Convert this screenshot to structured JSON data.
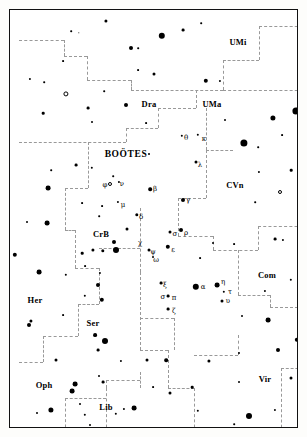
{
  "chart_data": {
    "type": "scatter",
    "subtitle": "",
    "xlabel": "",
    "ylabel": "",
    "grid": false,
    "legend": "none",
    "xlim": [
      0,
      289
    ],
    "ylim": [
      0,
      419
    ],
    "frame": {
      "left": 9,
      "top": 9,
      "width": 289,
      "height": 419,
      "border_color": "#111111"
    },
    "colors": {
      "star": "#000000",
      "boundary": "#999999",
      "background": "#ffffff",
      "label": "#000000"
    },
    "constellation_labels": [
      {
        "name": "UMi",
        "x": 228,
        "y": 32,
        "major": false
      },
      {
        "name": "Dra",
        "x": 139,
        "y": 94,
        "major": false
      },
      {
        "name": "UMa",
        "x": 202,
        "y": 94,
        "major": false
      },
      {
        "name": "BOOTES",
        "text": "BOÖTES",
        "x": 116,
        "y": 145,
        "major": true
      },
      {
        "name": "CVn",
        "x": 225,
        "y": 175,
        "major": false
      },
      {
        "name": "CrB",
        "x": 91,
        "y": 224,
        "major": false
      },
      {
        "name": "Com",
        "x": 257,
        "y": 265,
        "major": false
      },
      {
        "name": "Her",
        "x": 25,
        "y": 290,
        "major": false
      },
      {
        "name": "Ser",
        "x": 83,
        "y": 313,
        "major": false
      },
      {
        "name": "Oph",
        "x": 34,
        "y": 375,
        "major": false
      },
      {
        "name": "Lib",
        "x": 96,
        "y": 397,
        "major": false
      },
      {
        "name": "Vir",
        "x": 255,
        "y": 369,
        "major": false
      },
      {
        "name": "Crv",
        "x": 285,
        "y": 427,
        "major": false
      },
      {
        "name": "Sco",
        "x": 68,
        "y": 430,
        "major": false
      }
    ],
    "bayer_labels": [
      {
        "glyph": "θ",
        "x": 176,
        "y": 128
      },
      {
        "glyph": "κ",
        "x": 194,
        "y": 129
      },
      {
        "glyph": "λ",
        "x": 190,
        "y": 155
      },
      {
        "glyph": "φ",
        "x": 95,
        "y": 175
      },
      {
        "glyph": "ν",
        "x": 112,
        "y": 174
      },
      {
        "glyph": "β",
        "x": 145,
        "y": 179
      },
      {
        "glyph": "γ",
        "x": 178,
        "y": 190
      },
      {
        "glyph": "μ",
        "x": 113,
        "y": 195
      },
      {
        "glyph": "δ",
        "x": 131,
        "y": 207
      },
      {
        "glyph": "χ",
        "x": 130,
        "y": 233
      },
      {
        "glyph": "σ",
        "x": 165,
        "y": 224
      },
      {
        "glyph": "ρ",
        "x": 176,
        "y": 223
      },
      {
        "glyph": "ψ",
        "x": 143,
        "y": 242
      },
      {
        "glyph": "ε",
        "x": 163,
        "y": 240
      },
      {
        "glyph": "ω",
        "x": 146,
        "y": 250
      },
      {
        "glyph": "ξ",
        "x": 155,
        "y": 275
      },
      {
        "glyph": "α",
        "x": 193,
        "y": 277
      },
      {
        "glyph": "η",
        "x": 213,
        "y": 272
      },
      {
        "glyph": "σ",
        "x": 153,
        "y": 287
      },
      {
        "glyph": "π",
        "x": 164,
        "y": 288
      },
      {
        "glyph": "τ",
        "x": 220,
        "y": 282
      },
      {
        "glyph": "υ",
        "x": 218,
        "y": 291
      },
      {
        "glyph": "ζ",
        "x": 164,
        "y": 301
      }
    ],
    "stars": [
      {
        "x": 96,
        "y": 11,
        "r": 1.6
      },
      {
        "x": 173,
        "y": 20,
        "r": 1.4
      },
      {
        "x": 191,
        "y": 13,
        "r": 0.8
      },
      {
        "x": 152,
        "y": 26,
        "r": 3.2
      },
      {
        "x": 61,
        "y": 21,
        "r": 0.8
      },
      {
        "x": 69,
        "y": 23,
        "r": 0.7
      },
      {
        "x": 121,
        "y": 38,
        "r": 2.0
      },
      {
        "x": 128,
        "y": 38,
        "r": 0.8
      },
      {
        "x": 292,
        "y": 47,
        "r": 1.4
      },
      {
        "x": 53,
        "y": 51,
        "r": 0.9
      },
      {
        "x": 128,
        "y": 60,
        "r": 0.9
      },
      {
        "x": 144,
        "y": 64,
        "r": 1.5
      },
      {
        "x": 196,
        "y": 71,
        "r": 2.2
      },
      {
        "x": 210,
        "y": 71,
        "r": 1.1
      },
      {
        "x": 20,
        "y": 69,
        "r": 1.1
      },
      {
        "x": 34,
        "y": 72,
        "r": 0.8
      },
      {
        "x": 56,
        "y": 84,
        "r": 2.6,
        "open": true
      },
      {
        "x": 94,
        "y": 81,
        "r": 0.8
      },
      {
        "x": 78,
        "y": 98,
        "r": 1.4
      },
      {
        "x": 116,
        "y": 95,
        "r": 2.0
      },
      {
        "x": 33,
        "y": 103,
        "r": 1.3
      },
      {
        "x": 286,
        "y": 101,
        "r": 3.6
      },
      {
        "x": 263,
        "y": 108,
        "r": 2.6
      },
      {
        "x": 215,
        "y": 110,
        "r": 1.0
      },
      {
        "x": 172,
        "y": 126,
        "r": 1.2
      },
      {
        "x": 188,
        "y": 125,
        "r": 1.2
      },
      {
        "x": 82,
        "y": 112,
        "r": 1.0
      },
      {
        "x": 136,
        "y": 113,
        "r": 0.9
      },
      {
        "x": 234,
        "y": 133,
        "r": 3.6
      },
      {
        "x": 186,
        "y": 152,
        "r": 1.5
      },
      {
        "x": 139,
        "y": 144,
        "r": 1.0
      },
      {
        "x": 272,
        "y": 125,
        "r": 0.9
      },
      {
        "x": 248,
        "y": 137,
        "r": 0.8
      },
      {
        "x": 66,
        "y": 155,
        "r": 1.4
      },
      {
        "x": 82,
        "y": 158,
        "r": 1.2
      },
      {
        "x": 41,
        "y": 160,
        "r": 0.8
      },
      {
        "x": 103,
        "y": 166,
        "r": 0.8
      },
      {
        "x": 249,
        "y": 162,
        "r": 1.1
      },
      {
        "x": 281,
        "y": 160,
        "r": 1.3
      },
      {
        "x": 140,
        "y": 179,
        "r": 1.8
      },
      {
        "x": 173,
        "y": 190,
        "r": 2.0
      },
      {
        "x": 100,
        "y": 174,
        "r": 2.0,
        "open": true
      },
      {
        "x": 109,
        "y": 172,
        "r": 1.1
      },
      {
        "x": 38,
        "y": 178,
        "r": 2.4
      },
      {
        "x": 108,
        "y": 192,
        "r": 1.1
      },
      {
        "x": 72,
        "y": 193,
        "r": 0.9
      },
      {
        "x": 92,
        "y": 196,
        "r": 0.9
      },
      {
        "x": 270,
        "y": 182,
        "r": 2.0,
        "open": true
      },
      {
        "x": 292,
        "y": 171,
        "r": 1.1
      },
      {
        "x": 245,
        "y": 192,
        "r": 0.8
      },
      {
        "x": 127,
        "y": 205,
        "r": 1.7
      },
      {
        "x": 89,
        "y": 206,
        "r": 0.8
      },
      {
        "x": 17,
        "y": 212,
        "r": 1.0
      },
      {
        "x": 37,
        "y": 213,
        "r": 2.4
      },
      {
        "x": 117,
        "y": 219,
        "r": 1.5
      },
      {
        "x": 160,
        "y": 222,
        "r": 1.5
      },
      {
        "x": 171,
        "y": 220,
        "r": 2.0
      },
      {
        "x": 104,
        "y": 232,
        "r": 2.0
      },
      {
        "x": 158,
        "y": 237,
        "r": 2.2
      },
      {
        "x": 139,
        "y": 240,
        "r": 1.5
      },
      {
        "x": 143,
        "y": 247,
        "r": 1.0
      },
      {
        "x": 83,
        "y": 240,
        "r": 1.6
      },
      {
        "x": 93,
        "y": 241,
        "r": 1.7
      },
      {
        "x": 106,
        "y": 240,
        "r": 3.0
      },
      {
        "x": 72,
        "y": 243,
        "r": 1.3
      },
      {
        "x": 5,
        "y": 245,
        "r": 2.2
      },
      {
        "x": 203,
        "y": 233,
        "r": 1.0
      },
      {
        "x": 224,
        "y": 234,
        "r": 0.9
      },
      {
        "x": 265,
        "y": 229,
        "r": 1.4
      },
      {
        "x": 273,
        "y": 230,
        "r": 1.1
      },
      {
        "x": 190,
        "y": 248,
        "r": 0.9
      },
      {
        "x": 29,
        "y": 262,
        "r": 2.4
      },
      {
        "x": 56,
        "y": 265,
        "r": 1.2
      },
      {
        "x": 75,
        "y": 256,
        "r": 0.9
      },
      {
        "x": 90,
        "y": 263,
        "r": 1.1
      },
      {
        "x": 186,
        "y": 277,
        "r": 3.2
      },
      {
        "x": 207,
        "y": 275,
        "r": 2.4
      },
      {
        "x": 214,
        "y": 282,
        "r": 1.2
      },
      {
        "x": 212,
        "y": 291,
        "r": 1.5
      },
      {
        "x": 151,
        "y": 273,
        "r": 1.4
      },
      {
        "x": 158,
        "y": 286,
        "r": 1.4
      },
      {
        "x": 158,
        "y": 299,
        "r": 1.4
      },
      {
        "x": 88,
        "y": 275,
        "r": 2.0
      },
      {
        "x": 75,
        "y": 286,
        "r": 1.2
      },
      {
        "x": 92,
        "y": 290,
        "r": 2.2
      },
      {
        "x": 255,
        "y": 281,
        "r": 1.1
      },
      {
        "x": 281,
        "y": 270,
        "r": 1.2
      },
      {
        "x": 290,
        "y": 283,
        "r": 0.9
      },
      {
        "x": 53,
        "y": 305,
        "r": 0.9
      },
      {
        "x": 21,
        "y": 311,
        "r": 1.6
      },
      {
        "x": 19,
        "y": 315,
        "r": 2.0
      },
      {
        "x": 85,
        "y": 325,
        "r": 1.9
      },
      {
        "x": 95,
        "y": 331,
        "r": 3.0
      },
      {
        "x": 88,
        "y": 340,
        "r": 1.4
      },
      {
        "x": 258,
        "y": 310,
        "r": 2.4
      },
      {
        "x": 232,
        "y": 306,
        "r": 1.0
      },
      {
        "x": 268,
        "y": 340,
        "r": 2.0
      },
      {
        "x": 46,
        "y": 350,
        "r": 1.5
      },
      {
        "x": 111,
        "y": 351,
        "r": 1.1
      },
      {
        "x": 137,
        "y": 350,
        "r": 1.5
      },
      {
        "x": 156,
        "y": 350,
        "r": 1.8
      },
      {
        "x": 199,
        "y": 351,
        "r": 1.6
      },
      {
        "x": 229,
        "y": 343,
        "r": 1.0
      },
      {
        "x": 65,
        "y": 374,
        "r": 2.4
      },
      {
        "x": 62,
        "y": 381,
        "r": 2.4
      },
      {
        "x": 93,
        "y": 372,
        "r": 1.4
      },
      {
        "x": 89,
        "y": 366,
        "r": 1.0
      },
      {
        "x": 143,
        "y": 377,
        "r": 0.9
      },
      {
        "x": 160,
        "y": 383,
        "r": 1.5
      },
      {
        "x": 182,
        "y": 377,
        "r": 1.3
      },
      {
        "x": 229,
        "y": 372,
        "r": 1.0
      },
      {
        "x": 281,
        "y": 368,
        "r": 1.5
      },
      {
        "x": 287,
        "y": 330,
        "r": 2.2
      },
      {
        "x": 41,
        "y": 400,
        "r": 2.6
      },
      {
        "x": 27,
        "y": 403,
        "r": 1.0
      },
      {
        "x": 70,
        "y": 394,
        "r": 1.0
      },
      {
        "x": 75,
        "y": 405,
        "r": 1.2
      },
      {
        "x": 124,
        "y": 398,
        "r": 2.4
      },
      {
        "x": 106,
        "y": 404,
        "r": 1.2
      },
      {
        "x": 114,
        "y": 399,
        "r": 1.1
      },
      {
        "x": 188,
        "y": 401,
        "r": 1.2
      },
      {
        "x": 239,
        "y": 406,
        "r": 3.0
      },
      {
        "x": 265,
        "y": 400,
        "r": 1.1
      },
      {
        "x": 43,
        "y": 424,
        "r": 1.0
      },
      {
        "x": 102,
        "y": 421,
        "r": 1.5
      },
      {
        "x": 150,
        "y": 422,
        "r": 1.4,
        "open": true
      },
      {
        "x": 80,
        "y": 415,
        "r": 1.0
      },
      {
        "x": 237,
        "y": 425,
        "r": 1.0
      },
      {
        "x": 254,
        "y": 426,
        "r": 1.1
      },
      {
        "x": 293,
        "y": 430,
        "r": 1.8
      },
      {
        "x": 224,
        "y": 414,
        "r": 0.8
      }
    ],
    "boundaries": [
      {
        "o": "h",
        "x": 9,
        "y": 30,
        "len": 45
      },
      {
        "o": "v",
        "x": 54,
        "y": 30,
        "len": 16
      },
      {
        "o": "h",
        "x": 54,
        "y": 46,
        "len": 23
      },
      {
        "o": "v",
        "x": 77,
        "y": 46,
        "len": 24
      },
      {
        "o": "h",
        "x": 77,
        "y": 70,
        "len": 44
      },
      {
        "o": "v",
        "x": 121,
        "y": 70,
        "len": 10
      },
      {
        "o": "h",
        "x": 121,
        "y": 80,
        "len": 92
      },
      {
        "o": "v",
        "x": 213,
        "y": 50,
        "len": 30
      },
      {
        "o": "h",
        "x": 213,
        "y": 50,
        "len": 36
      },
      {
        "o": "v",
        "x": 249,
        "y": 16,
        "len": 34
      },
      {
        "o": "h",
        "x": 249,
        "y": 16,
        "len": 49
      },
      {
        "o": "h",
        "x": 213,
        "y": 80,
        "len": 85
      },
      {
        "o": "v",
        "x": 186,
        "y": 80,
        "len": 18
      },
      {
        "o": "h",
        "x": 148,
        "y": 98,
        "len": 38
      },
      {
        "o": "v",
        "x": 148,
        "y": 98,
        "len": 20
      },
      {
        "o": "h",
        "x": 116,
        "y": 118,
        "len": 32
      },
      {
        "o": "v",
        "x": 116,
        "y": 118,
        "len": 14
      },
      {
        "o": "h",
        "x": 9,
        "y": 132,
        "len": 107
      },
      {
        "o": "v",
        "x": 78,
        "y": 132,
        "len": 46
      },
      {
        "o": "h",
        "x": 55,
        "y": 178,
        "len": 23
      },
      {
        "o": "v",
        "x": 55,
        "y": 178,
        "len": 42
      },
      {
        "o": "h",
        "x": 55,
        "y": 220,
        "len": 10
      },
      {
        "o": "v",
        "x": 65,
        "y": 220,
        "len": 38
      },
      {
        "o": "h",
        "x": 65,
        "y": 258,
        "len": 24
      },
      {
        "o": "v",
        "x": 89,
        "y": 258,
        "len": 36
      },
      {
        "o": "h",
        "x": 68,
        "y": 294,
        "len": 21
      },
      {
        "o": "v",
        "x": 68,
        "y": 294,
        "len": 32
      },
      {
        "o": "h",
        "x": 33,
        "y": 326,
        "len": 35
      },
      {
        "o": "v",
        "x": 33,
        "y": 326,
        "len": 26
      },
      {
        "o": "h",
        "x": 9,
        "y": 352,
        "len": 24
      },
      {
        "o": "v",
        "x": 130,
        "y": 198,
        "len": 64
      },
      {
        "o": "h",
        "x": 130,
        "y": 198,
        "len": 0
      },
      {
        "o": "v",
        "x": 130,
        "y": 262,
        "len": 78
      },
      {
        "o": "h",
        "x": 130,
        "y": 340,
        "len": 28
      },
      {
        "o": "v",
        "x": 158,
        "y": 340,
        "len": 38
      },
      {
        "o": "h",
        "x": 158,
        "y": 378,
        "len": 26
      },
      {
        "o": "v",
        "x": 184,
        "y": 378,
        "len": 50
      },
      {
        "o": "v",
        "x": 196,
        "y": 98,
        "len": 42
      },
      {
        "o": "h",
        "x": 196,
        "y": 140,
        "len": 27
      },
      {
        "o": "v",
        "x": 223,
        "y": 140,
        "len": 0
      },
      {
        "o": "v",
        "x": 196,
        "y": 140,
        "len": 48
      },
      {
        "o": "h",
        "x": 168,
        "y": 188,
        "len": 28
      },
      {
        "o": "v",
        "x": 168,
        "y": 188,
        "len": 38
      },
      {
        "o": "h",
        "x": 168,
        "y": 226,
        "len": 35
      },
      {
        "o": "v",
        "x": 203,
        "y": 226,
        "len": 14
      },
      {
        "o": "h",
        "x": 203,
        "y": 240,
        "len": 45
      },
      {
        "o": "v",
        "x": 248,
        "y": 216,
        "len": 24
      },
      {
        "o": "h",
        "x": 248,
        "y": 216,
        "len": 50
      },
      {
        "o": "v",
        "x": 228,
        "y": 240,
        "len": 45
      },
      {
        "o": "h",
        "x": 228,
        "y": 285,
        "len": 32
      },
      {
        "o": "v",
        "x": 260,
        "y": 285,
        "len": 12
      },
      {
        "o": "h",
        "x": 260,
        "y": 297,
        "len": 38
      },
      {
        "o": "v",
        "x": 271,
        "y": 358,
        "len": 70
      },
      {
        "o": "h",
        "x": 271,
        "y": 358,
        "len": 27
      },
      {
        "o": "h",
        "x": 130,
        "y": 308,
        "len": 34
      },
      {
        "o": "v",
        "x": 164,
        "y": 308,
        "len": 32
      },
      {
        "o": "h",
        "x": 164,
        "y": 340,
        "len": 0
      },
      {
        "o": "h",
        "x": 89,
        "y": 238,
        "len": 41
      },
      {
        "o": "h",
        "x": 96,
        "y": 370,
        "len": 34
      },
      {
        "o": "v",
        "x": 96,
        "y": 370,
        "len": 8
      },
      {
        "o": "v",
        "x": 130,
        "y": 362,
        "len": 16
      },
      {
        "o": "h",
        "x": 55,
        "y": 388,
        "len": 41
      },
      {
        "o": "v",
        "x": 55,
        "y": 388,
        "len": 40
      },
      {
        "o": "v",
        "x": 96,
        "y": 378,
        "len": 50
      },
      {
        "o": "h",
        "x": 184,
        "y": 345,
        "len": 44
      },
      {
        "o": "v",
        "x": 184,
        "y": 345,
        "len": 0
      },
      {
        "o": "v",
        "x": 228,
        "y": 325,
        "len": 20
      },
      {
        "o": "h",
        "x": 228,
        "y": 325,
        "len": 0
      }
    ]
  }
}
